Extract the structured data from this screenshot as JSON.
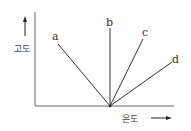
{
  "diagram": {
    "y_axis_label": "고도",
    "x_axis_label": "온도",
    "lines": [
      {
        "label": "a"
      },
      {
        "label": "b"
      },
      {
        "label": "c"
      },
      {
        "label": "d"
      }
    ]
  }
}
